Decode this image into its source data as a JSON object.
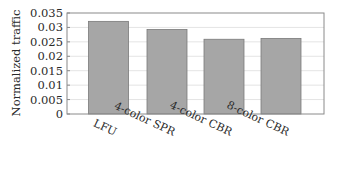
{
  "chart_data": {
    "type": "bar",
    "title": "",
    "xlabel": "",
    "ylabel": "Normalized traffic",
    "categories": [
      "LFU",
      "4-color SPR",
      "4-color CBR",
      "8-color CBR"
    ],
    "values": [
      0.0321,
      0.0293,
      0.0259,
      0.0262
    ],
    "ylim": [
      0,
      0.035
    ],
    "yticks": [
      0,
      0.005,
      0.01,
      0.015,
      0.02,
      0.025,
      0.03,
      0.035
    ],
    "ytick_labels": [
      "0",
      "0.005",
      "0.01",
      "0.015",
      "0.02",
      "0.025",
      "0.03",
      "0.035"
    ],
    "grid": "horizontal",
    "legend": "none",
    "bar_color": "#a6a6a6",
    "bar_edge_color": "#7a7a7a",
    "grid_color": "#e4e4e4",
    "frame_color": "#8a8a8a",
    "xtick_rotation_deg": 25
  }
}
